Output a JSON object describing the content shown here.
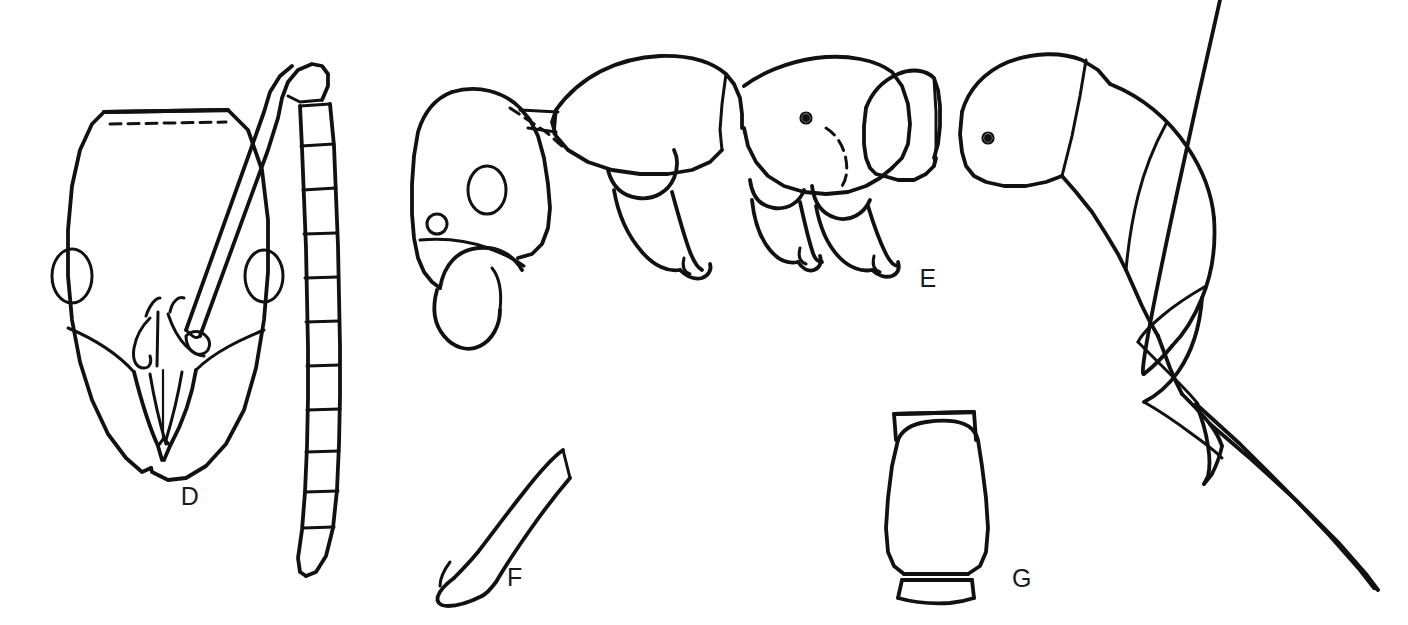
{
  "plate": {
    "kind": "scientific-line-illustration",
    "subject": "ant (Formicidae) morphology plate",
    "background_color": "#ffffff",
    "ink_color": "#111111",
    "width": 1408,
    "height": 625,
    "panel_count": 4
  },
  "labels": {
    "d": "D",
    "e": "E",
    "f": "F",
    "g": "G"
  },
  "panels": [
    {
      "id": "d",
      "label": "D",
      "view": "head in full-face (dorsal) view with antenna",
      "label_x": 190,
      "label_y": 505,
      "features": [
        "occipital margin with dashed hidden line",
        "paired lateral compound eyes",
        "clypeus with median longitudinal carina",
        "crossed sickle mandibles meeting apically",
        "scape directed dorso-laterally",
        "funiculus of 11 segments with elongate apical segment"
      ]
    },
    {
      "id": "e",
      "label": "E",
      "view": "body in lateral (profile) view",
      "label_x": 928,
      "label_y": 278,
      "features": [
        "head with compound eye and sickle mandible",
        "pronotum, mesonotum and propodeum",
        "propodeal spiracle",
        "petiolar node with dashed outline",
        "gaster of four visible tergites",
        "long projecting sting"
      ]
    },
    {
      "id": "f",
      "label": "F",
      "view": "mandible / subpetiolar process detail",
      "label_x": 515,
      "label_y": 577,
      "features": [
        "narrow acuminate blade",
        "basal angular shoulder"
      ]
    },
    {
      "id": "g",
      "label": "G",
      "view": "petiolar node in dorsal view",
      "label_x": 1022,
      "label_y": 578,
      "features": [
        "broadly rounded node",
        "anterior collar",
        "posterior basal band"
      ]
    }
  ]
}
